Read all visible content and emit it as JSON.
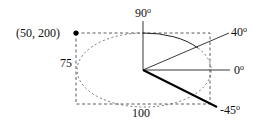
{
  "diagram": {
    "point_label": "(50, 200)",
    "height_label": "75",
    "width_label": "100",
    "angles": [
      {
        "label": "90",
        "degrees": 90
      },
      {
        "label": "40",
        "degrees": 40
      },
      {
        "label": "0",
        "degrees": 0
      },
      {
        "label": "-45",
        "degrees": -45
      }
    ],
    "degree_symbol": "o",
    "colors": {
      "stroke": "#111111",
      "background": "#ffffff"
    }
  }
}
